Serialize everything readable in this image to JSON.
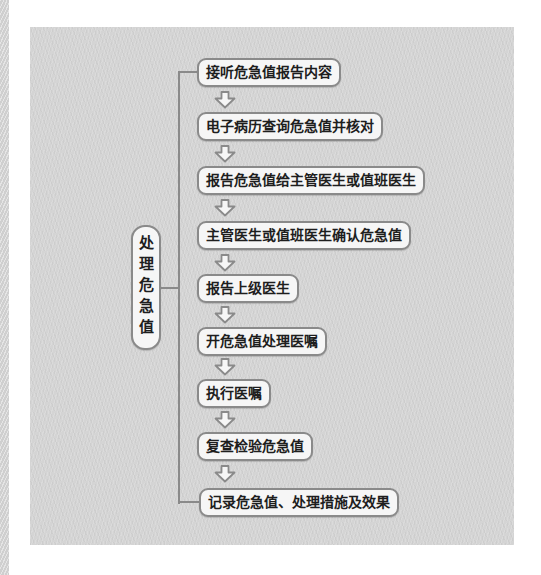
{
  "flowchart": {
    "root": {
      "label": "处理危急值"
    },
    "steps": [
      {
        "label": "接听危急值报告内容"
      },
      {
        "label": "电子病历查询危急值并核对"
      },
      {
        "label": "报告危急值给主管医生或值班医生"
      },
      {
        "label": "主管医生或值班医生确认危急值"
      },
      {
        "label": "报告上级医生"
      },
      {
        "label": "开危急值处理医嘱"
      },
      {
        "label": "执行医嘱"
      },
      {
        "label": "复查检验危急值"
      },
      {
        "label": "记录危急值、处理措施及效果"
      }
    ],
    "colors": {
      "panel_background": "#d4d4d4",
      "box_fill": "#f6f6f6",
      "box_border": "#8a8a8a",
      "text": "#1e1e1e",
      "connector": "#8a8a8a",
      "arrow_fill": "#f6f6f6",
      "arrow_outline": "#8a8a8a",
      "page_background": "#ffffff"
    }
  }
}
